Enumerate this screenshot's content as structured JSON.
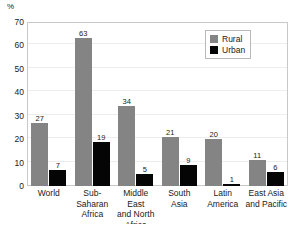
{
  "chart_data": {
    "type": "bar",
    "title": "",
    "subtitle": "",
    "xlabel": "",
    "ylabel": "%",
    "ylim": [
      0,
      70
    ],
    "yticks": [
      0,
      10,
      20,
      30,
      40,
      50,
      60,
      70
    ],
    "grid": true,
    "legend_position": "top-right",
    "categories": [
      "World",
      "Sub-Saharan Africa",
      "Middle East and North Africa",
      "South Asia",
      "Latin America",
      "East Asia and Pacific"
    ],
    "category_lines": [
      [
        "World"
      ],
      [
        "Sub-",
        "Saharan",
        "Africa"
      ],
      [
        "Middle East",
        "and North",
        "Africa"
      ],
      [
        "South",
        "Asia"
      ],
      [
        "Latin",
        "America"
      ],
      [
        "East Asia",
        "and Pacific"
      ]
    ],
    "series": [
      {
        "name": "Rural",
        "color": "#848484",
        "values": [
          27,
          63,
          34,
          21,
          20,
          11
        ]
      },
      {
        "name": "Urban",
        "color": "#050505",
        "values": [
          7,
          19,
          5,
          9,
          1,
          6
        ]
      }
    ]
  },
  "colors": {
    "rural": "#848484",
    "urban": "#050505",
    "frame": "#c9c9c9",
    "grid": "#ededed",
    "text": "#1a1a1a",
    "background": "#ffffff"
  }
}
